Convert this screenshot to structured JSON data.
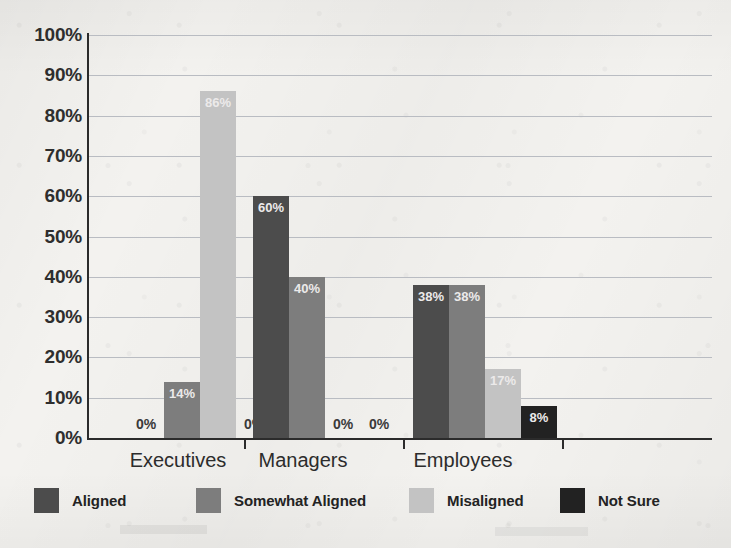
{
  "chart_data": {
    "type": "bar",
    "title": "",
    "subtitle": "",
    "xlabel": "",
    "ylabel": "",
    "ylim": [
      0,
      100
    ],
    "ytick_labels": [
      "100%",
      "90%",
      "80%",
      "70%",
      "60%",
      "50%",
      "40%",
      "30%",
      "20%",
      "10%",
      "0%"
    ],
    "ytick_values": [
      100,
      90,
      80,
      70,
      60,
      50,
      40,
      30,
      20,
      10,
      0
    ],
    "grid": "horizontal",
    "legend_position": "bottom",
    "categories": [
      "Executives",
      "Managers",
      "Employees"
    ],
    "series": [
      {
        "name": "Aligned",
        "color": "#4c4c4c",
        "values": [
          0,
          60,
          38
        ],
        "labels": [
          "0%",
          "60%",
          "38%"
        ]
      },
      {
        "name": "Somewhat Aligned",
        "color": "#7d7d7d",
        "values": [
          14,
          40,
          38
        ],
        "labels": [
          "14%",
          "40%",
          "38%"
        ]
      },
      {
        "name": "Misaligned",
        "color": "#c3c3c3",
        "values": [
          86,
          0,
          17
        ],
        "labels": [
          "86%",
          "0%",
          "17%"
        ]
      },
      {
        "name": "Not Sure",
        "color": "#222222",
        "values": [
          0,
          0,
          8
        ],
        "labels": [
          "0%",
          "0%",
          "8%"
        ]
      }
    ]
  },
  "legend": {
    "items": [
      {
        "label": "Aligned"
      },
      {
        "label": "Somewhat Aligned"
      },
      {
        "label": "Misaligned"
      },
      {
        "label": "Not Sure"
      }
    ]
  }
}
